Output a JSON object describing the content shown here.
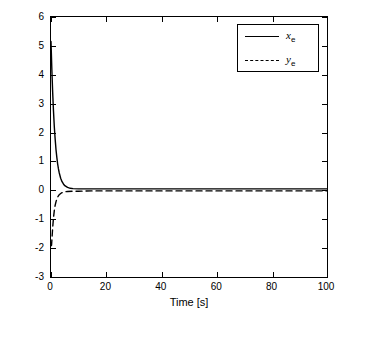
{
  "chart_data": {
    "type": "line",
    "title": "",
    "xlabel": "Time [s]",
    "ylabel": "",
    "xlim": [
      0,
      100
    ],
    "ylim": [
      -3,
      6
    ],
    "xticks": [
      0,
      20,
      40,
      60,
      80,
      100
    ],
    "yticks": [
      -3,
      -2,
      -1,
      0,
      1,
      2,
      3,
      4,
      5,
      6
    ],
    "grid": false,
    "legend_position": "top-right",
    "series": [
      {
        "name": "x_e",
        "label": "x",
        "sublabel": "e",
        "style": "solid",
        "color": "#000000",
        "x": [
          0,
          0.3,
          0.6,
          0.9,
          1.2,
          1.5,
          1.8,
          2.1,
          2.4,
          2.7,
          3.0,
          3.5,
          4.0,
          4.5,
          5.0,
          6.0,
          7.0,
          8.0,
          10.0,
          12.0,
          15.0,
          20.0,
          30.0,
          40.0,
          60.0,
          80.0,
          100.0
        ],
        "y": [
          5.15,
          4.2,
          3.4,
          2.75,
          2.2,
          1.78,
          1.42,
          1.15,
          0.92,
          0.74,
          0.6,
          0.42,
          0.3,
          0.22,
          0.16,
          0.1,
          0.07,
          0.06,
          0.05,
          0.05,
          0.05,
          0.05,
          0.05,
          0.05,
          0.05,
          0.05,
          0.05
        ]
      },
      {
        "name": "y_e",
        "label": "y",
        "sublabel": "e",
        "style": "dashed",
        "color": "#000000",
        "x": [
          0,
          0.2,
          0.4,
          0.6,
          0.9,
          1.2,
          1.5,
          1.8,
          2.1,
          2.5,
          3.0,
          3.5,
          4.0,
          5.0,
          6.0,
          8.0,
          10.0,
          15.0,
          20.0,
          40.0,
          60.0,
          80.0,
          100.0
        ],
        "y": [
          -1.92,
          -1.9,
          -1.6,
          -1.3,
          -0.95,
          -0.7,
          -0.52,
          -0.4,
          -0.3,
          -0.22,
          -0.15,
          -0.11,
          -0.08,
          -0.05,
          -0.04,
          -0.03,
          -0.03,
          -0.02,
          -0.02,
          -0.02,
          -0.02,
          -0.02,
          -0.02
        ]
      }
    ]
  },
  "axes": {
    "x_tick_labels": [
      "0",
      "20",
      "40",
      "60",
      "80",
      "100"
    ],
    "y_tick_labels": [
      "-3",
      "-2",
      "-1",
      "0",
      "1",
      "2",
      "3",
      "4",
      "5",
      "6"
    ],
    "x_axis_title": "Time [s]"
  }
}
